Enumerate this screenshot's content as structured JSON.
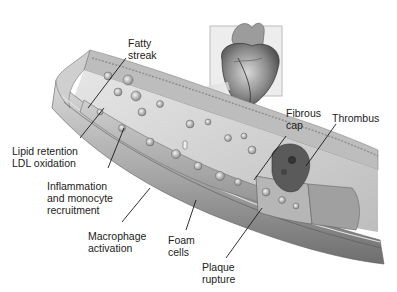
{
  "diagram": {
    "inset": {
      "name": "heart-illustration",
      "frame_color": "#bcbcbc"
    },
    "labels": [
      {
        "id": "fatty-streak",
        "lines": [
          "Fatty",
          "streak"
        ]
      },
      {
        "id": "lipid-retention",
        "lines": [
          "Lipid retention",
          "LDL oxidation"
        ]
      },
      {
        "id": "inflammation",
        "lines": [
          "Inflammation",
          "and monocyte",
          "recruitment"
        ]
      },
      {
        "id": "macrophage",
        "lines": [
          "Macrophage",
          "activation"
        ]
      },
      {
        "id": "foam-cells",
        "lines": [
          "Foam",
          "cells"
        ]
      },
      {
        "id": "plaque-rupture",
        "lines": [
          "Plaque",
          "rupture"
        ]
      },
      {
        "id": "fibrous-cap",
        "lines": [
          "Fibrous",
          "cap"
        ]
      },
      {
        "id": "thrombus",
        "lines": [
          "Thrombus"
        ]
      }
    ],
    "colors": {
      "background": "#ffffff",
      "text": "#222222",
      "leader_line": "#1a1a1a",
      "vessel_wall": "#9a9a9a",
      "vessel_inner": "#c8c8c8",
      "plaque": "#b0b0b0",
      "thrombus": "#5a5a5a"
    }
  }
}
